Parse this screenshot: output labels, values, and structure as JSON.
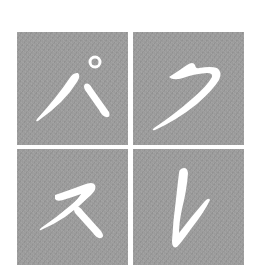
{
  "title": "パズル",
  "colors": {
    "background": "#ffffff",
    "tile": "#9a9a9a",
    "glyph": "#ffffff"
  },
  "tiles": [
    {
      "position": "top-left",
      "character": "パ",
      "reading": "pa"
    },
    {
      "position": "top-right",
      "character": "ク",
      "reading": "ku"
    },
    {
      "position": "bottom-left",
      "character": "ス",
      "reading": "su"
    },
    {
      "position": "bottom-right",
      "character": "レ",
      "reading": "re"
    }
  ]
}
